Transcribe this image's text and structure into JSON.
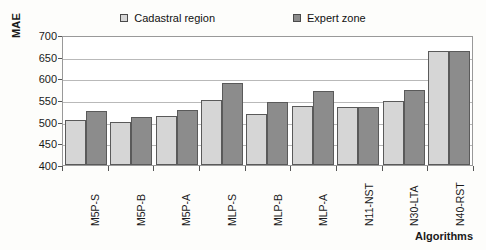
{
  "chart_data": {
    "type": "bar",
    "title": "",
    "xlabel": "Algorithms",
    "ylabel": "MAE",
    "ylim": [
      400,
      700
    ],
    "ytick_step": 50,
    "yticks": [
      700,
      650,
      600,
      550,
      500,
      450,
      400
    ],
    "grid": true,
    "legend_position": "top-center",
    "categories": [
      "M5P-S",
      "M5P-B",
      "M5P-A",
      "MLP-S",
      "MLP-B",
      "MLP-A",
      "N11-NST",
      "N30-LTA",
      "N40-RST"
    ],
    "series": [
      {
        "name": "Cadastral region",
        "color": "#d6d6d6",
        "values": [
          505,
          499,
          512,
          550,
          518,
          536,
          535,
          548,
          662
        ]
      },
      {
        "name": "Expert zone",
        "color": "#8c8c8c",
        "values": [
          524,
          510,
          527,
          590,
          546,
          570,
          534,
          572,
          662
        ]
      }
    ]
  },
  "legend": {
    "items": [
      {
        "label": "Cadastral region",
        "swatch": "light-gray-square-icon"
      },
      {
        "label": "Expert zone",
        "swatch": "dark-gray-square-icon"
      }
    ]
  },
  "axes": {
    "y_title": "MAE",
    "x_title": "Algorithms"
  }
}
